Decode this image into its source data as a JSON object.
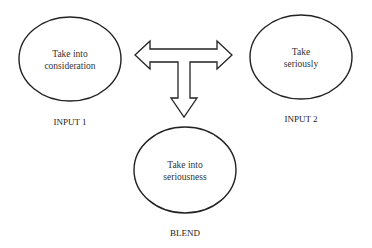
{
  "diagram": {
    "nodes": [
      {
        "id": "input1",
        "lines": [
          "Take into",
          "consideration"
        ],
        "label": "INPUT 1"
      },
      {
        "id": "input2",
        "lines": [
          "Take",
          "seriously"
        ],
        "label": "INPUT 2"
      },
      {
        "id": "blend",
        "lines": [
          "Take into",
          "seriousness"
        ],
        "label": "BLEND"
      }
    ],
    "arrow": {
      "type": "T-shaped block arrow",
      "directions": [
        "left",
        "right",
        "down"
      ],
      "points_to": [
        "input1",
        "input2",
        "blend"
      ]
    },
    "colors": {
      "stroke": "#222222",
      "background": "#ffffff",
      "text": "#333333"
    }
  }
}
